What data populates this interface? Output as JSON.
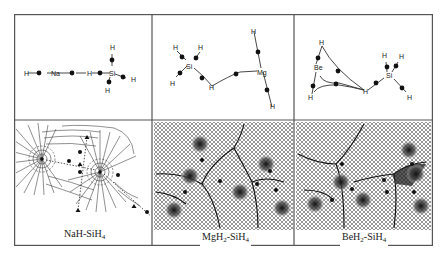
{
  "figure": {
    "panels": [
      {
        "id": "nah-sih4",
        "caption": {
          "base": "NaH-SiH",
          "sub": "4",
          "full": "NaH-SiH4"
        },
        "molecule_atoms": [
          "H",
          "Na",
          "H",
          "Si",
          "H",
          "H",
          "H"
        ],
        "labels": {
          "h1": "H",
          "na": "Na",
          "h2": "H",
          "si": "Si",
          "h_top": "H",
          "h_right": "H",
          "h_bottom": "H"
        }
      },
      {
        "id": "mgh2-sih4",
        "caption": {
          "base1": "MgH",
          "sub1": "2",
          "mid": "-SiH",
          "sub2": "4",
          "full": "MgH2-SiH4"
        },
        "molecule_atoms": [
          "Si",
          "H",
          "H",
          "H",
          "H",
          "Mg",
          "H",
          "H"
        ],
        "labels": {
          "si": "Si",
          "h_tl": "H",
          "h_tr": "H",
          "h_bl": "H",
          "h_bridge": "H",
          "mg": "Mg",
          "h_mg_top": "H",
          "h_mg_bottom": "H"
        }
      },
      {
        "id": "beh2-sih4",
        "caption": {
          "base1": "BeH",
          "sub1": "2",
          "mid": "-SiH",
          "sub2": "4",
          "full": "BeH2-SiH4"
        },
        "molecule_atoms": [
          "Be",
          "H",
          "H",
          "H",
          "Si",
          "H",
          "H",
          "H"
        ],
        "labels": {
          "be": "Be",
          "h_top": "H",
          "h_bottom": "H",
          "h_bridge": "H",
          "si": "Si",
          "h_si1": "H",
          "h_si2": "H",
          "h_si3": "H"
        }
      }
    ],
    "colors": {
      "frame": "#555555",
      "bond": "#333333",
      "bcp": "#111111",
      "gradient_line": "#2a2a2a"
    }
  }
}
